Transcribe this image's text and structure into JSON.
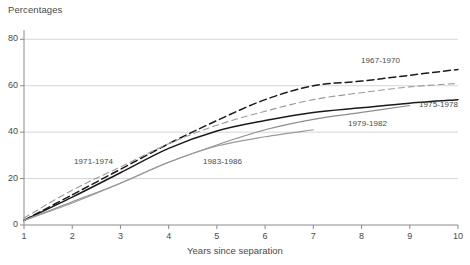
{
  "chart_data": {
    "type": "line",
    "title": "",
    "ylabel": "Percentages",
    "xlabel": "Years since separation",
    "x": [
      1,
      2,
      3,
      4,
      5,
      6,
      7,
      8,
      9,
      10
    ],
    "xlim": [
      1,
      10
    ],
    "ylim": [
      0,
      84
    ],
    "yticks": [
      0,
      20,
      40,
      60,
      80
    ],
    "xticks": [
      1,
      2,
      3,
      4,
      5,
      6,
      7,
      8,
      9,
      10
    ],
    "grid": "horizontal",
    "legend": "inline-annotations",
    "series": [
      {
        "name": "1967-1970",
        "style": "dashed",
        "color": "#1a1a1a",
        "values": [
          2,
          13,
          24,
          35,
          45,
          54,
          60,
          62,
          64.5,
          67
        ]
      },
      {
        "name": "1971-1974",
        "style": "dashed",
        "color": "#9a9a9a",
        "values": [
          3,
          15,
          25,
          35,
          43,
          49,
          54,
          57,
          59.5,
          61
        ]
      },
      {
        "name": "1975-1978",
        "style": "solid",
        "color": "#1a1a1a",
        "values": [
          2,
          12,
          22.5,
          33,
          40.5,
          45,
          48.5,
          50.5,
          52.5,
          54
        ]
      },
      {
        "name": "1979-1982",
        "style": "solid",
        "color": "#8c8c8c",
        "values": [
          2,
          10,
          18,
          27,
          34.5,
          41,
          45.5,
          48.5,
          51.5,
          null
        ]
      },
      {
        "name": "1983-1986",
        "style": "solid",
        "color": "#9a9a9a",
        "values": [
          2,
          9.5,
          18,
          27,
          34,
          38,
          41,
          null,
          null,
          null
        ]
      }
    ]
  },
  "axis": {
    "y_title": "Percentages",
    "x_title": "Years since separation",
    "y_tick_labels": [
      "0",
      "20",
      "40",
      "60",
      "80"
    ],
    "x_tick_labels": [
      "1",
      "2",
      "3",
      "4",
      "5",
      "6",
      "7",
      "8",
      "9",
      "10"
    ]
  },
  "annotations": [
    {
      "text": "1967-1970",
      "left": 361,
      "top": 56
    },
    {
      "text": "1975-1978",
      "left": 419,
      "top": 100
    },
    {
      "text": "1979-1982",
      "left": 348,
      "top": 119
    },
    {
      "text": "1971-1974",
      "left": 74,
      "top": 157
    },
    {
      "text": "1983-1986",
      "left": 203,
      "top": 157
    }
  ],
  "colors": {
    "grid": "#d6d6d6",
    "axis": "#8a8a8a",
    "text": "#4a4a4a",
    "dark_series": "#1a1a1a",
    "light_series": "#9a9a9a"
  }
}
